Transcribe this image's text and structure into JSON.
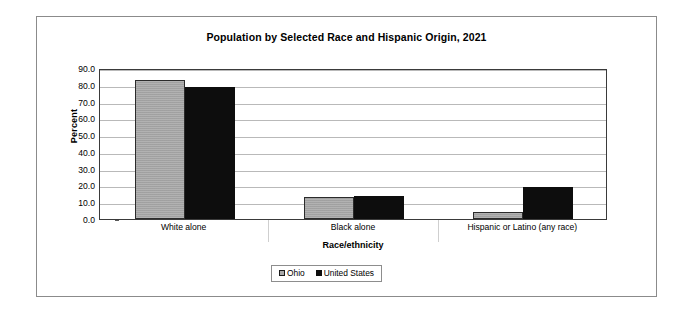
{
  "chart_data": {
    "type": "bar",
    "title": "Population by Selected Race and Hispanic Origin, 2021",
    "xlabel": "Race/ethnicity",
    "ylabel": "Percent",
    "categories": [
      "White alone",
      "Black alone",
      "Hispanic or Latino (any race)"
    ],
    "series": [
      {
        "name": "Ohio",
        "values": [
          82.7,
          13.4,
          4.4
        ],
        "color": "#a9a9a9"
      },
      {
        "name": "United States",
        "values": [
          78.9,
          13.6,
          18.9
        ],
        "color": "#0d0d0d"
      }
    ],
    "ylim": [
      0,
      90
    ],
    "yticks": [
      "90.0",
      "80.0",
      "70.0",
      "60.0",
      "50.0",
      "40.0",
      "30.0",
      "20.0",
      "10.0",
      "0.0"
    ],
    "ytick_values": [
      90,
      80,
      70,
      60,
      50,
      40,
      30,
      20,
      10,
      0
    ],
    "grid": true,
    "legend_position": "bottom-center",
    "legend": [
      "Ohio",
      "United States"
    ]
  }
}
